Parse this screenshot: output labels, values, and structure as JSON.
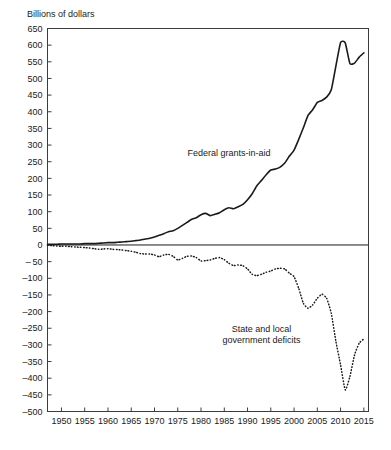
{
  "chart_data": {
    "type": "line",
    "title": "",
    "ylabel": "Billions of dollars",
    "xlabel": "",
    "ylim": [
      -500,
      650
    ],
    "xlim": [
      1947,
      2016
    ],
    "grid": false,
    "legend_position": "inline-annotations",
    "ytick_labels": [
      "650",
      "600",
      "550",
      "500",
      "450",
      "400",
      "350",
      "300",
      "250",
      "200",
      "150",
      "100",
      "50",
      "0",
      "– 50",
      "–100",
      "–150",
      "–200",
      "–250",
      "–300",
      "–350",
      "–400",
      "–450",
      "–500"
    ],
    "ytick_values": [
      650,
      600,
      550,
      500,
      450,
      400,
      350,
      300,
      250,
      200,
      150,
      100,
      50,
      0,
      -50,
      -100,
      -150,
      -200,
      -250,
      -300,
      -350,
      -400,
      -450,
      -500
    ],
    "xtick_labels": [
      "1950",
      "1955",
      "1960",
      "1965",
      "1970",
      "1975",
      "1980",
      "1985",
      "1990",
      "1995",
      "2000",
      "2005",
      "2010",
      "2015"
    ],
    "xtick_values": [
      1950,
      1955,
      1960,
      1965,
      1970,
      1975,
      1980,
      1985,
      1990,
      1995,
      2000,
      2005,
      2010,
      2015
    ],
    "zero_reference_line": 0,
    "series": [
      {
        "name": "Federal grants-in-aid",
        "style": "solid",
        "color": "#1a1a1a",
        "annotation": "Federal grants-in-aid",
        "annotation_x": 1986,
        "annotation_y": 268,
        "x": [
          1947,
          1948,
          1949,
          1950,
          1951,
          1952,
          1953,
          1954,
          1955,
          1956,
          1957,
          1958,
          1959,
          1960,
          1961,
          1962,
          1963,
          1964,
          1965,
          1966,
          1967,
          1968,
          1969,
          1970,
          1971,
          1972,
          1973,
          1974,
          1975,
          1976,
          1977,
          1978,
          1979,
          1980,
          1981,
          1982,
          1983,
          1984,
          1985,
          1986,
          1987,
          1988,
          1989,
          1990,
          1991,
          1992,
          1993,
          1994,
          1995,
          1996,
          1997,
          1998,
          1999,
          2000,
          2001,
          2002,
          2003,
          2004,
          2005,
          2006,
          2007,
          2008,
          2009,
          2010,
          2011,
          2012,
          2013,
          2014,
          2015
        ],
        "y": [
          2,
          2,
          2,
          3,
          3,
          3,
          3,
          3,
          4,
          4,
          4,
          5,
          6,
          7,
          7,
          8,
          9,
          10,
          11,
          13,
          15,
          18,
          20,
          24,
          29,
          34,
          40,
          43,
          50,
          59,
          68,
          77,
          82,
          91,
          95,
          88,
          92,
          97,
          106,
          112,
          109,
          115,
          122,
          136,
          154,
          178,
          194,
          211,
          225,
          228,
          234,
          246,
          267,
          285,
          317,
          352,
          389,
          406,
          428,
          434,
          444,
          466,
          538,
          608,
          607,
          545,
          546,
          564,
          577
        ]
      },
      {
        "name": "State and local government deficits",
        "style": "dotted",
        "color": "#1a1a1a",
        "annotation_lines": [
          "State and local",
          "government deficits"
        ],
        "annotation_x": 1993,
        "annotation_y": -262,
        "x": [
          1947,
          1948,
          1949,
          1950,
          1951,
          1952,
          1953,
          1954,
          1955,
          1956,
          1957,
          1958,
          1959,
          1960,
          1961,
          1962,
          1963,
          1964,
          1965,
          1966,
          1967,
          1968,
          1969,
          1970,
          1971,
          1972,
          1973,
          1974,
          1975,
          1976,
          1977,
          1978,
          1979,
          1980,
          1981,
          1982,
          1983,
          1984,
          1985,
          1986,
          1987,
          1988,
          1989,
          1990,
          1991,
          1992,
          1993,
          1994,
          1995,
          1996,
          1997,
          1998,
          1999,
          2000,
          2001,
          2002,
          2003,
          2004,
          2005,
          2006,
          2007,
          2008,
          2009,
          2010,
          2011,
          2012,
          2013,
          2014,
          2015
        ],
        "y": [
          -1,
          -2,
          -3,
          -4,
          -4,
          -5,
          -6,
          -7,
          -8,
          -9,
          -11,
          -13,
          -12,
          -11,
          -13,
          -14,
          -15,
          -17,
          -19,
          -22,
          -26,
          -27,
          -27,
          -30,
          -35,
          -30,
          -28,
          -34,
          -45,
          -40,
          -34,
          -33,
          -38,
          -48,
          -47,
          -45,
          -40,
          -38,
          -44,
          -55,
          -62,
          -60,
          -62,
          -72,
          -88,
          -92,
          -88,
          -82,
          -78,
          -72,
          -70,
          -72,
          -85,
          -95,
          -130,
          -175,
          -190,
          -180,
          -160,
          -148,
          -160,
          -205,
          -290,
          -360,
          -435,
          -395,
          -330,
          -295,
          -282
        ]
      }
    ]
  }
}
